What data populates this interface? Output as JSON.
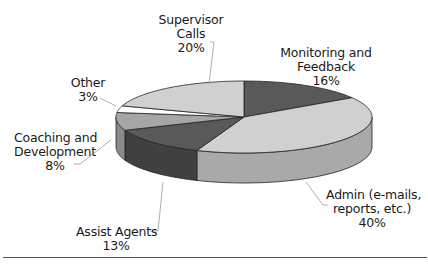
{
  "chart_data": {
    "type": "pie",
    "style": "3d-exploded-none",
    "title": "",
    "categories": [
      "Supervisor Calls",
      "Monitoring and Feedback",
      "Admin (e-mails, reports, etc.)",
      "Assist Agents",
      "Coaching and Development",
      "Other"
    ],
    "values": [
      20,
      16,
      40,
      13,
      8,
      3
    ],
    "unit": "%",
    "colors": [
      "#d0d0d0",
      "#595959",
      "#d0d0d0",
      "#595959",
      "#a6a6a6",
      "#ffffff"
    ],
    "side_colors": [
      "#a9a9a9",
      "#404040",
      "#a9a9a9",
      "#404040",
      "#8a8a8a",
      "#e6e6e6"
    ],
    "legend": "none",
    "data_labels": true
  },
  "labels": {
    "supervisor": {
      "line1": "Supervisor",
      "line2": "Calls",
      "pct": "20%"
    },
    "monitoring": {
      "line1": "Monitoring and",
      "line2": "Feedback",
      "pct": "16%"
    },
    "admin": {
      "line1": "Admin (e-mails,",
      "line2": "reports, etc.)",
      "pct": "40%"
    },
    "assist": {
      "line1": "Assist Agents",
      "pct": "13%"
    },
    "coaching": {
      "line1": "Coaching and",
      "line2": "Development",
      "pct": "8%"
    },
    "other": {
      "line1": "Other",
      "pct": "3%"
    }
  }
}
